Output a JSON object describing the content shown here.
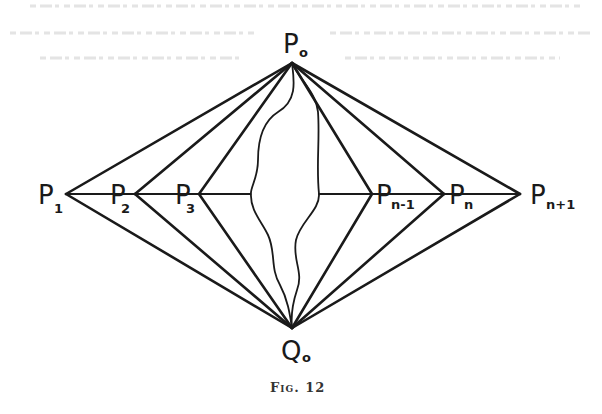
{
  "figure": {
    "caption": "Fig. 12",
    "ink_color": "#1a1a1a",
    "background": "#ffffff",
    "top_vertex": {
      "id": "P0",
      "letter": "P",
      "subscript": "o"
    },
    "bottom_vertex": {
      "id": "Q0",
      "letter": "Q",
      "subscript": "o"
    },
    "row_points": [
      {
        "id": "P1",
        "letter": "P",
        "subscript": "1"
      },
      {
        "id": "P2",
        "letter": "P",
        "subscript": "2"
      },
      {
        "id": "P3",
        "letter": "P",
        "subscript": "3"
      },
      {
        "id": "Pn-1",
        "letter": "P",
        "subscript": "n-1"
      },
      {
        "id": "Pn",
        "letter": "P",
        "subscript": "n"
      },
      {
        "id": "Pn+1",
        "letter": "P",
        "subscript": "n+1"
      }
    ],
    "edges_description": "Each row point P1..Pn+1 is joined to both P0 and Q0; P1..Pn+1 lie on a horizontal line broken by two wavy curves from P0 to Q0"
  }
}
